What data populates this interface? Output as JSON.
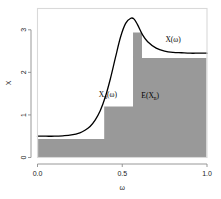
{
  "figure": {
    "background": "#ffffff",
    "frame_color": "#d9d9d9",
    "axis_color": "#8c8c8c",
    "curve_color": "#000000",
    "step_fill": "#999999",
    "step_edge": "#ffffff"
  },
  "axes": {
    "x": {
      "title": "ω",
      "ticks": [
        "0.0",
        "0.5",
        "1.0"
      ],
      "tick_values": [
        0.0,
        0.5,
        1.0
      ],
      "lim": [
        0.0,
        1.0
      ]
    },
    "y": {
      "title": "X",
      "ticks": [
        "0",
        "1",
        "2",
        "3"
      ],
      "tick_values": [
        0,
        1,
        2,
        3
      ],
      "lim": [
        0,
        3.5
      ]
    }
  },
  "annotations": [
    {
      "name": "curve-label",
      "base": "X",
      "sub": "",
      "tail": "(ω)",
      "x": 0.8,
      "y": 2.72
    },
    {
      "name": "step-label",
      "base": "X",
      "sub": "n",
      "tail": "(ω)",
      "x": 0.415,
      "y": 1.42
    },
    {
      "name": "area-label",
      "base": "E(X",
      "sub": "n",
      "tail": ")",
      "x": 0.665,
      "y": 1.4
    }
  ],
  "chart_data": {
    "type": "area",
    "title": "",
    "xlabel": "ω",
    "ylabel": "X",
    "xlim": [
      0.0,
      1.0
    ],
    "ylim": [
      0,
      3.5
    ],
    "grid": false,
    "legend": "none",
    "series": [
      {
        "name": "X(ω)",
        "type": "line",
        "color": "#000000",
        "x": [
          0.0,
          0.05,
          0.1,
          0.15,
          0.2,
          0.25,
          0.28,
          0.31,
          0.34,
          0.37,
          0.4,
          0.43,
          0.46,
          0.49,
          0.52,
          0.55,
          0.57,
          0.59,
          0.62,
          0.65,
          0.7,
          0.75,
          0.8,
          0.85,
          0.9,
          0.95,
          1.0
        ],
        "y": [
          0.5,
          0.5,
          0.5,
          0.51,
          0.53,
          0.58,
          0.64,
          0.73,
          0.88,
          1.1,
          1.42,
          1.85,
          2.35,
          2.83,
          3.15,
          3.27,
          3.25,
          3.12,
          2.88,
          2.72,
          2.57,
          2.5,
          2.47,
          2.46,
          2.45,
          2.45,
          2.45
        ]
      },
      {
        "name": "X_n(ω)",
        "type": "step",
        "color": "#999999",
        "steps": [
          {
            "x0": 0.0,
            "x1": 0.39,
            "height": 0.45
          },
          {
            "x0": 0.39,
            "x1": 0.56,
            "height": 1.21
          },
          {
            "x0": 0.56,
            "x1": 0.62,
            "height": 2.95
          },
          {
            "x0": 0.62,
            "x1": 1.0,
            "height": 2.35
          }
        ]
      }
    ]
  }
}
